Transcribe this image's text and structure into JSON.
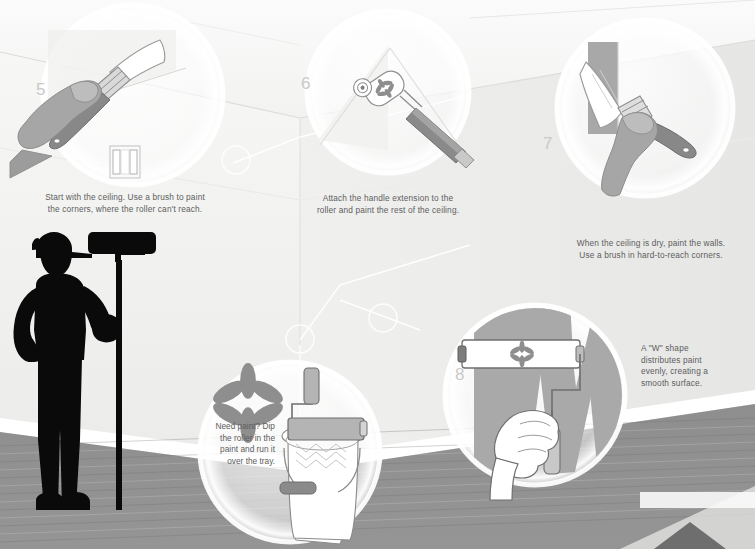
{
  "poster": {
    "title": "How to paint a room — steps 5 to 8",
    "background_color": "#f2f2f1",
    "floor_color": "#8c8c8c",
    "accent_gray": "#a0a0a0",
    "text_color": "#5d5d5d",
    "number_color": "#c9c9c9"
  },
  "steps": [
    {
      "number": "5",
      "caption_lines": [
        "Start with the ceiling. Use a brush to paint",
        "the corners, where the roller can't reach."
      ],
      "icon": "hand-with-paintbrush-icon",
      "sub_icon": "paint-tray-icon"
    },
    {
      "number": "6",
      "caption_lines": [
        "Attach the handle extension to the",
        "roller and paint the rest of the ceiling."
      ],
      "icon": "roller-with-extension-handle-icon"
    },
    {
      "number": "7",
      "caption_lines": [
        "When the ceiling is dry, paint the walls.",
        "Use a brush in hard-to-reach corners."
      ],
      "icon": "hand-painting-wall-corner-icon"
    },
    {
      "number": "8",
      "caption_lines": [
        "A \"W\" shape",
        "distributes paint",
        "evenly, creating a",
        "smooth surface."
      ],
      "icon": "roller-painting-w-shape-icon"
    }
  ],
  "bucket_note": {
    "caption_lines": [
      "Need paint? Dip",
      "the roller in the",
      "paint and run it",
      "over the tray."
    ],
    "icon": "roller-and-paint-bucket-icon",
    "logo": "flower-asterisk-icon"
  },
  "painter": {
    "icon": "painter-silhouette-icon",
    "description": "Silhouette of painter holding long-handled roller"
  },
  "page_arrow": {
    "icon": "next-page-triangle-icon",
    "color": "#6e6e6e"
  }
}
